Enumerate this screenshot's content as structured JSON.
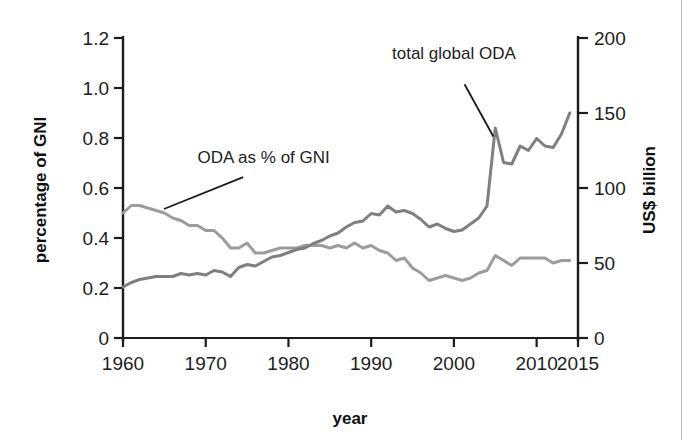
{
  "figure": {
    "background": "#ffffff",
    "border_color": "#b9b9b9"
  },
  "chart_data": {
    "type": "line",
    "title": "",
    "xlabel": "year",
    "grid": false,
    "legend_position": "inline-annotations",
    "x": [
      1960,
      1961,
      1962,
      1963,
      1964,
      1965,
      1966,
      1967,
      1968,
      1969,
      1970,
      1971,
      1972,
      1973,
      1974,
      1975,
      1976,
      1977,
      1978,
      1979,
      1980,
      1981,
      1982,
      1983,
      1984,
      1985,
      1986,
      1987,
      1988,
      1989,
      1990,
      1991,
      1992,
      1993,
      1994,
      1995,
      1996,
      1997,
      1998,
      1999,
      2000,
      2001,
      2002,
      2003,
      2004,
      2005,
      2006,
      2007,
      2008,
      2009,
      2010,
      2011,
      2012,
      2013,
      2014
    ],
    "xlim": [
      1960,
      2015
    ],
    "xticks": [
      1960,
      1970,
      1980,
      1990,
      2000,
      2010,
      2015
    ],
    "xticklabels": [
      "1960",
      "1970",
      "1980",
      "1990",
      "2000",
      "2010",
      "2015"
    ],
    "axes": [
      {
        "side": "left",
        "label": "percentage of GNI",
        "lim": [
          0,
          1.2
        ],
        "ticks": [
          0,
          0.2,
          0.4,
          0.6,
          0.8,
          1.0,
          1.2
        ],
        "ticklabels": [
          "0",
          "0.2",
          "0.4",
          "0.6",
          "0.8",
          "1.0",
          "1.2"
        ]
      },
      {
        "side": "right",
        "label": "US$ billion",
        "lim": [
          0,
          200
        ],
        "ticks": [
          0,
          50,
          100,
          150,
          200
        ],
        "ticklabels": [
          "0",
          "50",
          "100",
          "150",
          "200"
        ]
      }
    ],
    "series": [
      {
        "name": "ODA as % of GNI",
        "axis": "left",
        "unit": "percent of GNI",
        "color": "#9c9c9c",
        "values": [
          0.5,
          0.53,
          0.53,
          0.52,
          0.51,
          0.5,
          0.48,
          0.47,
          0.45,
          0.45,
          0.43,
          0.43,
          0.4,
          0.36,
          0.36,
          0.38,
          0.34,
          0.34,
          0.35,
          0.36,
          0.36,
          0.36,
          0.37,
          0.37,
          0.37,
          0.36,
          0.37,
          0.36,
          0.38,
          0.36,
          0.37,
          0.35,
          0.34,
          0.31,
          0.32,
          0.28,
          0.26,
          0.23,
          0.24,
          0.25,
          0.24,
          0.23,
          0.24,
          0.26,
          0.27,
          0.33,
          0.31,
          0.29,
          0.32,
          0.32,
          0.32,
          0.32,
          0.3,
          0.31,
          0.31
        ]
      },
      {
        "name": "total global ODA",
        "axis": "right",
        "unit": "US$ billion",
        "color": "#7f7f7f",
        "values": [
          34,
          37,
          39,
          40,
          41,
          41,
          41,
          43,
          42,
          43,
          42,
          45,
          44,
          41,
          47,
          49,
          48,
          51,
          54,
          55,
          57,
          59,
          60,
          63,
          65,
          68,
          70,
          74,
          77,
          78,
          83,
          82,
          88,
          84,
          85,
          83,
          79,
          74,
          76,
          73,
          71,
          72,
          76,
          80,
          88,
          140,
          117,
          116,
          128,
          125,
          133,
          128,
          127,
          136,
          150
        ]
      }
    ],
    "annotations": [
      {
        "id": "total-global-oda",
        "text": "total global ODA",
        "text_x": 2000,
        "text_y_billion": 186,
        "target_x": 2005,
        "target_y_billion": 132
      },
      {
        "id": "oda-as-pct-of-gni",
        "text": "ODA as % of GNI",
        "text_x": 1977,
        "text_y_pct": 0.7,
        "target_x": 1964.5,
        "target_y_pct": 0.51
      }
    ]
  }
}
